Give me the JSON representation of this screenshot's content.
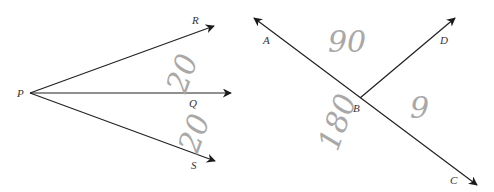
{
  "diagram": {
    "left_figure": {
      "vertex": {
        "label": "P",
        "x": 30,
        "y": 93
      },
      "rays": [
        {
          "name": "PR",
          "end_label": "R",
          "x2": 214,
          "y2": 26,
          "label_x": 192,
          "label_y": 24
        },
        {
          "name": "PQ",
          "end_label": "Q",
          "x2": 231,
          "y2": 93,
          "label_x": 189,
          "label_y": 107
        },
        {
          "name": "PS",
          "end_label": "S",
          "x2": 215,
          "y2": 161,
          "label_x": 191,
          "label_y": 169
        }
      ],
      "handwritten_annotations": [
        {
          "text": "20",
          "x": 168,
          "y": 90,
          "rotate": -70
        },
        {
          "text": "20",
          "x": 180,
          "y": 150,
          "rotate": -70
        }
      ]
    },
    "right_figure": {
      "vertex": {
        "label": "B",
        "x": 360,
        "y": 98
      },
      "line_AC": {
        "start_label": "A",
        "x1": 254,
        "y1": 18,
        "end_label": "C",
        "x2": 477,
        "y2": 185,
        "A_label_x": 263,
        "A_label_y": 44,
        "C_label_x": 450,
        "C_label_y": 184
      },
      "ray_BD": {
        "end_label": "D",
        "x2": 455,
        "y2": 18,
        "D_label_x": 440,
        "D_label_y": 44
      },
      "B_label_x": 353,
      "B_label_y": 112,
      "handwritten_annotations": [
        {
          "text": "90",
          "x": 328,
          "y": 52,
          "rotate": 0
        },
        {
          "text": "180",
          "x": 318,
          "y": 145,
          "rotate": -70
        },
        {
          "text": "9",
          "x": 410,
          "y": 118,
          "rotate": 0
        }
      ]
    },
    "colors": {
      "line": "#222222",
      "label": "#333333",
      "handwriting": "#a0a0a0",
      "background": "#ffffff"
    }
  }
}
